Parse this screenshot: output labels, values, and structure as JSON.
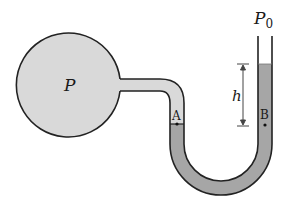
{
  "diagram": {
    "type": "open-tube manometer",
    "labels": {
      "bulb_pressure": "P",
      "atmospheric_pressure_symbol": "P",
      "atmospheric_pressure_subscript": "0",
      "height": "h",
      "point_a": "A",
      "point_b": "B"
    },
    "colors": {
      "gas_fill": "#d9d9d9",
      "liquid_fill": "#a6a6a6",
      "outline": "#222222",
      "background": "#ffffff"
    }
  }
}
